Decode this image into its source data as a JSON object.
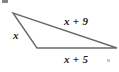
{
  "figure": {
    "type": "geometry-diagram",
    "shape": "triangle",
    "background_color": "#ffffff",
    "stroke_color": "#6b6b6b",
    "stroke_width": 1.4,
    "text_color": "#1a1a1a",
    "vertices": [
      {
        "name": "top-left-vertex",
        "x": 13,
        "y": 13
      },
      {
        "name": "bottom-left-vertex",
        "x": 37,
        "y": 48
      },
      {
        "name": "right-vertex",
        "x": 117,
        "y": 48
      }
    ],
    "labels": {
      "left_side": "x",
      "upper_right_side": "x + 9",
      "bottom_side": "x + 5"
    },
    "artifacts": [
      {
        "name": "speck-top-left",
        "x": 2,
        "y": 0
      },
      {
        "name": "speck-bottom-right",
        "x": 107,
        "y": 59
      }
    ]
  }
}
